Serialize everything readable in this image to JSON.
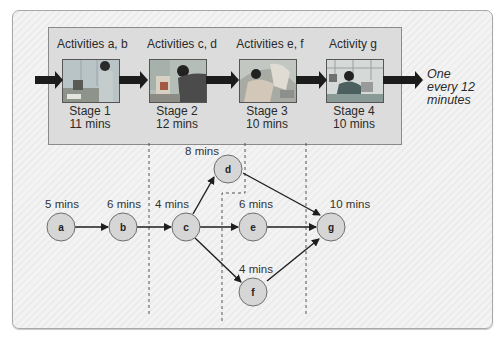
{
  "stages": [
    {
      "activities": "Activities a, b",
      "name": "Stage 1",
      "time": "11 mins",
      "photo": "worker-at-bench-image"
    },
    {
      "activities": "Activities c, d",
      "name": "Stage 2",
      "time": "12 mins",
      "photo": "worker-assembling-image"
    },
    {
      "activities": "Activities e, f",
      "name": "Stage 3",
      "time": "10 mins",
      "photo": "worker-fitting-image"
    },
    {
      "activities": "Activity g",
      "name": "Stage 4",
      "time": "10 mins",
      "photo": "worker-at-computer-image"
    }
  ],
  "output": {
    "line1": "One",
    "line2": "every 12",
    "line3": "minutes"
  },
  "network": {
    "nodes": [
      {
        "id": "a",
        "label": "a",
        "duration": "5 mins"
      },
      {
        "id": "b",
        "label": "b",
        "duration": "6 mins"
      },
      {
        "id": "c",
        "label": "c",
        "duration": "4 mins"
      },
      {
        "id": "d",
        "label": "d",
        "duration": "8 mins"
      },
      {
        "id": "e",
        "label": "e",
        "duration": "6 mins"
      },
      {
        "id": "f",
        "label": "f",
        "duration": "4 mins"
      },
      {
        "id": "g",
        "label": "g",
        "duration": "10 mins"
      }
    ],
    "edges": [
      [
        "a",
        "b"
      ],
      [
        "b",
        "c"
      ],
      [
        "c",
        "d"
      ],
      [
        "c",
        "e"
      ],
      [
        "c",
        "f"
      ],
      [
        "d",
        "g"
      ],
      [
        "e",
        "g"
      ],
      [
        "f",
        "g"
      ]
    ]
  },
  "colors": {
    "node_fill": "#d6d6d6",
    "node_stroke": "#6e6e6e",
    "arrow": "#1e1e1e",
    "stage_box": "#dcdcdc"
  }
}
